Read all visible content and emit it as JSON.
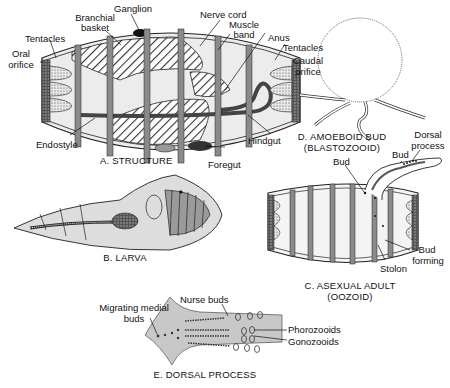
{
  "figure": {
    "panels": [
      {
        "id": "A",
        "caption": "A. STRUCTURE"
      },
      {
        "id": "B",
        "caption": "B. LARVA"
      },
      {
        "id": "C",
        "caption_line1": "C. ASEXUAL ADULT",
        "caption_line2": "(OOZOID)"
      },
      {
        "id": "D",
        "caption_line1": "D. AMOEBOID BUD",
        "caption_line2": "(BLASTOZOOID)"
      },
      {
        "id": "E",
        "caption": "E. DORSAL PROCESS"
      }
    ]
  },
  "labels": {
    "a": {
      "ganglion": "Ganglion",
      "branchial_1": "Branchial",
      "branchial_2": "basket",
      "nerve_cord": "Nerve cord",
      "muscle_1": "Muscle",
      "muscle_2": "band",
      "anus": "Anus",
      "tentacles_left": "Tentacles",
      "tentacles_right": "Tentacles",
      "oral_1": "Oral",
      "oral_2": "orifice",
      "caudal_1": "Caudal",
      "caudal_2": "orifice",
      "endostyle": "Endostyle",
      "hindgut": "Hindgut",
      "foregut": "Foregut"
    },
    "c": {
      "bud_left": "Bud",
      "bud_right": "Bud",
      "dorsal_1": "Dorsal",
      "dorsal_2": "process",
      "bud_forming_1": "Bud",
      "bud_forming_2": "forming",
      "stolon": "Stolon"
    },
    "e": {
      "migrating_1": "Migrating medial",
      "migrating_2": "buds",
      "nurse": "Nurse buds",
      "phorozooids": "Phorozooids",
      "gonozooids": "Gonozooids"
    }
  }
}
